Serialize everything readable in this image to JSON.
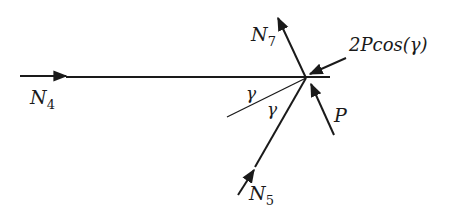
{
  "diagram": {
    "title": "",
    "junction": {
      "x": 306,
      "y": 78
    },
    "forces": [
      {
        "id": "N4",
        "label": "N",
        "subscript": "4",
        "direction": "horizontal, pointing right toward junction"
      },
      {
        "id": "N7",
        "label": "N",
        "subscript": "7",
        "direction": "away from junction, up-left"
      },
      {
        "id": "N5",
        "label": "N",
        "subscript": "5",
        "direction": "toward junction, up-right"
      },
      {
        "id": "2Pcos",
        "label": "2Pcos(γ)",
        "direction": "into junction from upper-right"
      },
      {
        "id": "P",
        "label": "P",
        "direction": "into junction from lower-right"
      }
    ],
    "angles": [
      {
        "label": "γ",
        "between": "horizontal member and bisector line"
      },
      {
        "label": "γ",
        "between": "bisector line and N5 member"
      }
    ],
    "colors": {
      "line": "#1a1a1a",
      "background": "#ffffff"
    }
  },
  "labels": {
    "n4": "N",
    "n4_sub": "4",
    "n7": "N",
    "n7_sub": "7",
    "n5": "N",
    "n5_sub": "5",
    "force_2pcos": "2Pcos(γ)",
    "force_p": "P",
    "gamma_upper": "γ",
    "gamma_lower": "γ"
  }
}
